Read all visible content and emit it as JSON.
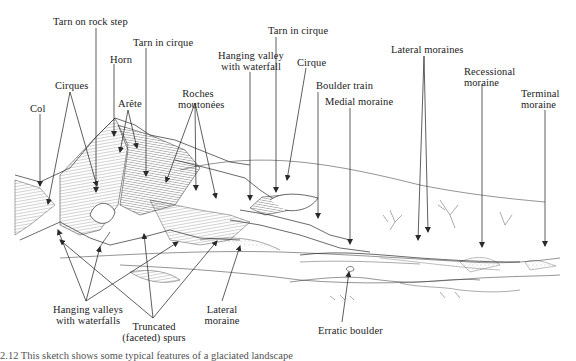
{
  "figure": {
    "caption": "2.12  This sketch shows some typical features of a glaciated landscape"
  },
  "labels": {
    "col": "Col",
    "cirques": "Cirques",
    "tarn_rock_step": "Tarn on rock step",
    "horn": "Horn",
    "arete": "Arête",
    "tarn_cirque_1": "Tarn in cirque",
    "roches_1": "Roches",
    "roches_2": "moutonées",
    "hanging_valley_1": "Hanging valley",
    "hanging_valley_2": "with waterfall",
    "tarn_cirque_2": "Tarn in cirque",
    "cirque": "Cirque",
    "boulder_train": "Boulder train",
    "medial_moraine": "Medial moraine",
    "lateral_moraines": "Lateral moraines",
    "recessional_1": "Recessional",
    "recessional_2": "moraine",
    "terminal_1": "Terminal",
    "terminal_2": "moraine",
    "hanging_valleys_1": "Hanging valleys",
    "hanging_valleys_2": "with waterfalls",
    "truncated_1": "Truncated",
    "truncated_2": "(faceted) spurs",
    "lateral_moraine_1": "Lateral",
    "lateral_moraine_2": "moraine",
    "erratic_boulder": "Erratic boulder"
  },
  "colors": {
    "ink": "#2a2a2a",
    "hatch": "#555555",
    "paper": "#ffffff"
  }
}
